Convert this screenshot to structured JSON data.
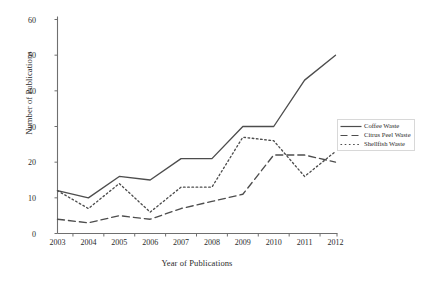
{
  "chart_data": {
    "type": "line",
    "title": "",
    "xlabel": "Year of Publications",
    "ylabel": "Number of Publications",
    "categories": [
      "2003",
      "2004",
      "2005",
      "2006",
      "2007",
      "2008",
      "2009",
      "2010",
      "2011",
      "2012"
    ],
    "x": [
      2003,
      2004,
      2005,
      2006,
      2007,
      2008,
      2009,
      2010,
      2011,
      2012
    ],
    "xlim": [
      2003,
      2012
    ],
    "ylim": [
      0,
      60
    ],
    "yticks": [
      0,
      10,
      20,
      30,
      40,
      50,
      60
    ],
    "grid": false,
    "legend_position": "right",
    "series": [
      {
        "name": "Coffee Waste",
        "style": "solid",
        "color": "#4d4d4d",
        "values": [
          12,
          10,
          16,
          15,
          21,
          21,
          30,
          30,
          43,
          50
        ]
      },
      {
        "name": "Citrus Peel Waste",
        "style": "dashed",
        "color": "#4d4d4d",
        "values": [
          4,
          3,
          5,
          4,
          7,
          9,
          11,
          22,
          22,
          20
        ]
      },
      {
        "name": "Shellfish Waste",
        "style": "dotted",
        "color": "#4d4d4d",
        "values": [
          12,
          7,
          14,
          6,
          13,
          13,
          27,
          26,
          16,
          23
        ]
      }
    ]
  },
  "axes": {
    "y_tick_labels": [
      "60",
      "50",
      "40",
      "30",
      "20",
      "10",
      "0"
    ],
    "x_tick_labels": [
      "2003",
      "2004",
      "2005",
      "2006",
      "2007",
      "2008",
      "2009",
      "2010",
      "2011",
      "2012"
    ],
    "ylabel": "Number of Publications",
    "xlabel": "Year of Publications"
  },
  "legend": {
    "items": [
      {
        "label": "Coffee Waste",
        "style": "solid"
      },
      {
        "label": "Citrus Peel Waste",
        "style": "dashed"
      },
      {
        "label": "Shellfish Waste",
        "style": "dotted"
      }
    ]
  },
  "colors": {
    "line": "#4d4d4d",
    "axis": "#6f6f6f",
    "text": "#2b2b2b",
    "background": "#ffffff"
  }
}
